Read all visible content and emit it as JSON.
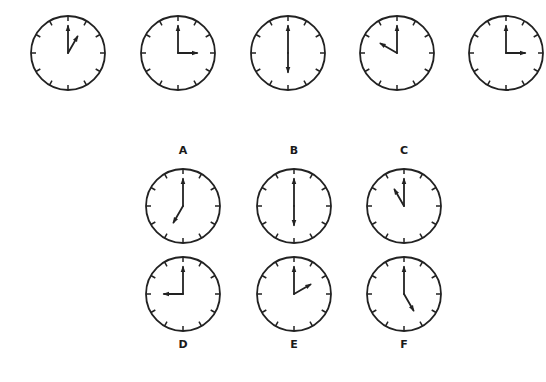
{
  "colors": {
    "stroke": "#222222",
    "background": "#ffffff",
    "label": "#1a1a1a"
  },
  "sequence": {
    "clocks": [
      {
        "id": "seq-1",
        "time": "1:00",
        "hour": 1,
        "minute": 0,
        "cx": 68,
        "cy": 53
      },
      {
        "id": "seq-2",
        "time": "3:00",
        "hour": 3,
        "minute": 0,
        "cx": 178,
        "cy": 53
      },
      {
        "id": "seq-3",
        "time": "6:00",
        "hour": 6,
        "minute": 0,
        "cx": 288,
        "cy": 53
      },
      {
        "id": "seq-4",
        "time": "10:00",
        "hour": 10,
        "minute": 0,
        "cx": 397,
        "cy": 53
      },
      {
        "id": "seq-5",
        "time": "3:00",
        "hour": 3,
        "minute": 0,
        "cx": 506,
        "cy": 53
      }
    ]
  },
  "options": [
    {
      "label": "A",
      "time": "7:00",
      "hour": 7,
      "minute": 0,
      "cx": 183,
      "cy": 206,
      "label_y": 151
    },
    {
      "label": "B",
      "time": "6:00",
      "hour": 6,
      "minute": 0,
      "cx": 294,
      "cy": 206,
      "label_y": 151
    },
    {
      "label": "C",
      "time": "11:00",
      "hour": 11,
      "minute": 0,
      "cx": 404,
      "cy": 206,
      "label_y": 151
    },
    {
      "label": "D",
      "time": "9:00",
      "hour": 9,
      "minute": 0,
      "cx": 183,
      "cy": 294,
      "label_y": 345
    },
    {
      "label": "E",
      "time": "2:00",
      "hour": 2,
      "minute": 0,
      "cx": 294,
      "cy": 294,
      "label_y": 345
    },
    {
      "label": "F",
      "time": "5:00",
      "hour": 5,
      "minute": 0,
      "cx": 404,
      "cy": 294,
      "label_y": 345
    }
  ]
}
